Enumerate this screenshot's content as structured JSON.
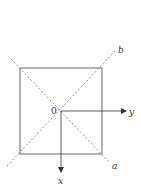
{
  "diagram": {
    "type": "geometry",
    "colors": {
      "stroke": "#555555",
      "dashed": "#888888",
      "text": "#333333",
      "background": "#ffffff"
    },
    "square": {
      "x": 20,
      "y": 68,
      "width": 82,
      "height": 86
    },
    "origin": {
      "label": "0",
      "x": 61,
      "y": 111
    },
    "diagonals": [
      {
        "label": "b",
        "x1": 7,
        "y1": 166,
        "x2": 115,
        "y2": 51,
        "style": "dashed"
      },
      {
        "label": "a",
        "x1": 11,
        "y1": 59,
        "x2": 110,
        "y2": 163,
        "style": "dashed"
      }
    ],
    "axes": [
      {
        "label": "y",
        "direction": "right",
        "x1": 61,
        "y1": 111,
        "x2": 126,
        "y2": 111
      },
      {
        "label": "x",
        "direction": "down",
        "x1": 61,
        "y1": 111,
        "x2": 61,
        "y2": 172
      }
    ],
    "labels": {
      "origin": "0",
      "a": "a",
      "b": "b",
      "x": "x",
      "y": "y"
    }
  }
}
